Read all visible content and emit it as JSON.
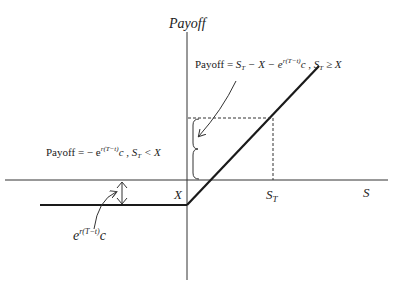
{
  "diagram": {
    "title": "Payoff",
    "axis_labels": {
      "y": "Payoff",
      "x": "S",
      "strike": "X",
      "spot_at_expiry": "S",
      "spot_at_expiry_sub": "T"
    },
    "annotations": {
      "upper_formula": {
        "prefix": "Payoff = ",
        "S": "S",
        "S_sub": "T",
        "mid": " − X − e",
        "exp": "r(T−t)",
        "c": "c",
        "cond_sep": " , ",
        "cond_S": "S",
        "cond_sub": "T",
        "cond": " ≥ X"
      },
      "lower_formula": {
        "prefix": "Payoff = − e",
        "exp": "r(T−t)",
        "c": "c",
        "cond_sep": " , ",
        "cond_S": "S",
        "cond_sub": "T",
        "cond": " < X"
      },
      "premium_label": {
        "e": "e",
        "exp": "r(T−t)",
        "c": "c"
      }
    },
    "colors": {
      "line": "#1a1a1a",
      "axis": "#333333",
      "text": "#222222"
    }
  }
}
